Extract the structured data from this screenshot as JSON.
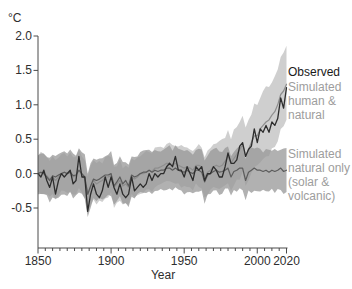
{
  "figure": {
    "unit_label": "°C",
    "xlabel": "Year"
  },
  "legend": {
    "observed": {
      "label": "Observed",
      "color": "#1a1a1a"
    },
    "human_natural": {
      "label": "Simulated\nhuman &\nnatural",
      "color": "#9d9d9d"
    },
    "natural_only": {
      "label": "Simulated\nnatural only\n(solar &\nvolcanic)",
      "color": "#9d9d9d"
    }
  },
  "colors": {
    "axis": "#4a4a4a",
    "tick_label": "#2e2e2e",
    "observed_line": "#2d2d2d",
    "human_natural_line": "#8e8e8e",
    "human_natural_band": "#bfbfbf",
    "natural_only_line": "#5c5c5c",
    "natural_only_band": "#979797"
  },
  "chart_data": {
    "type": "line",
    "title": "",
    "xlabel": "Year",
    "ylabel": "°C",
    "x_start": 1850,
    "x_step": 2,
    "xlim": [
      1850,
      2020
    ],
    "ylim": [
      -0.5,
      2.0
    ],
    "grid": false,
    "legend_position": "right-outside",
    "yticks": [
      2.0,
      1.5,
      1.0,
      0.5,
      0.0,
      -0.5
    ],
    "ytick_labels": [
      "2.0",
      "1.5",
      "1.0",
      "0.5",
      "0.0",
      "-0.5"
    ],
    "xticks_major": [
      1850,
      1900,
      1950,
      2000,
      2020
    ],
    "xtick_labels": [
      "1850",
      "1900",
      "1950",
      "2000",
      "2020"
    ],
    "xtick_minor_step": 5,
    "series": [
      {
        "name": "Observed",
        "color": "#2d2d2d",
        "line_width": 1.3,
        "values": [
          0.0,
          -0.05,
          0.05,
          -0.1,
          -0.2,
          -0.05,
          -0.3,
          -0.1,
          0.0,
          -0.05,
          0.0,
          0.05,
          -0.15,
          -0.1,
          0.25,
          -0.05,
          -0.05,
          -0.55,
          -0.3,
          -0.15,
          -0.3,
          -0.35,
          -0.25,
          -0.05,
          -0.2,
          -0.05,
          -0.2,
          -0.3,
          -0.15,
          -0.3,
          -0.35,
          -0.3,
          -0.05,
          -0.25,
          -0.2,
          -0.15,
          -0.2,
          -0.15,
          0.0,
          -0.1,
          0.0,
          -0.05,
          0.0,
          0.0,
          0.1,
          0.15,
          0.1,
          0.25,
          0.05,
          0.05,
          -0.05,
          0.1,
          0.0,
          -0.1,
          0.1,
          0.05,
          0.1,
          -0.1,
          0.0,
          0.0,
          0.1,
          0.05,
          -0.05,
          -0.05,
          0.1,
          0.3,
          0.15,
          0.15,
          0.2,
          0.4,
          0.45,
          0.25,
          0.35,
          0.4,
          0.65,
          0.45,
          0.65,
          0.6,
          0.7,
          0.6,
          0.75,
          0.7,
          0.8,
          1.1,
          0.95,
          1.25
        ]
      },
      {
        "name": "Simulated human & natural",
        "color": "#8e8e8e",
        "line_width": 1.2,
        "band_color": "#bfbfbf",
        "band_opacity": 0.75,
        "band": {
          "halfwidth_base": 0.28,
          "ramp_start_year": 1960,
          "halfwidth_max": 0.55
        },
        "values": [
          0.0,
          0.02,
          0.0,
          -0.03,
          -0.08,
          -0.05,
          -0.1,
          -0.05,
          0.0,
          0.02,
          0.0,
          0.02,
          -0.05,
          -0.03,
          0.05,
          -0.02,
          -0.08,
          -0.3,
          -0.2,
          -0.1,
          -0.15,
          -0.12,
          -0.1,
          -0.05,
          -0.05,
          -0.02,
          -0.2,
          -0.15,
          -0.1,
          -0.18,
          -0.15,
          -0.2,
          -0.05,
          -0.08,
          -0.05,
          0.0,
          0.0,
          0.02,
          0.05,
          0.03,
          0.08,
          0.08,
          0.1,
          0.12,
          0.15,
          0.15,
          0.12,
          0.15,
          0.12,
          0.1,
          0.08,
          0.1,
          0.08,
          0.05,
          0.12,
          0.12,
          0.1,
          -0.05,
          0.02,
          0.05,
          0.1,
          0.12,
          0.1,
          0.12,
          0.18,
          0.25,
          0.15,
          0.22,
          0.28,
          0.35,
          0.42,
          0.25,
          0.35,
          0.45,
          0.55,
          0.55,
          0.65,
          0.7,
          0.75,
          0.78,
          0.85,
          0.9,
          1.0,
          1.15,
          1.2,
          1.3
        ]
      },
      {
        "name": "Simulated natural only (solar & volcanic)",
        "color": "#5c5c5c",
        "line_width": 1.2,
        "band_color": "#979797",
        "band_opacity": 0.75,
        "band": {
          "halfwidth_base": 0.3,
          "ramp_start_year": null,
          "halfwidth_max": 0.3
        },
        "values": [
          0.0,
          0.02,
          0.0,
          -0.05,
          -0.1,
          -0.03,
          -0.05,
          -0.02,
          0.0,
          0.02,
          0.0,
          0.02,
          -0.03,
          -0.02,
          0.05,
          0.0,
          -0.05,
          -0.3,
          -0.18,
          -0.08,
          -0.1,
          -0.08,
          -0.05,
          -0.02,
          -0.02,
          0.0,
          -0.18,
          -0.12,
          -0.05,
          -0.15,
          -0.1,
          -0.18,
          -0.02,
          -0.05,
          -0.03,
          0.0,
          0.02,
          0.02,
          0.05,
          0.02,
          0.05,
          0.03,
          0.05,
          0.05,
          0.08,
          0.08,
          0.05,
          0.08,
          0.05,
          0.03,
          0.02,
          0.05,
          0.02,
          0.0,
          0.05,
          0.05,
          0.02,
          -0.12,
          -0.02,
          0.0,
          0.03,
          0.05,
          0.02,
          0.03,
          0.05,
          0.08,
          -0.05,
          0.03,
          0.05,
          0.08,
          0.08,
          -0.1,
          0.02,
          0.05,
          0.08,
          0.05,
          0.05,
          0.03,
          0.05,
          0.02,
          0.05,
          0.03,
          0.05,
          0.08,
          0.03,
          0.05
        ]
      }
    ]
  }
}
